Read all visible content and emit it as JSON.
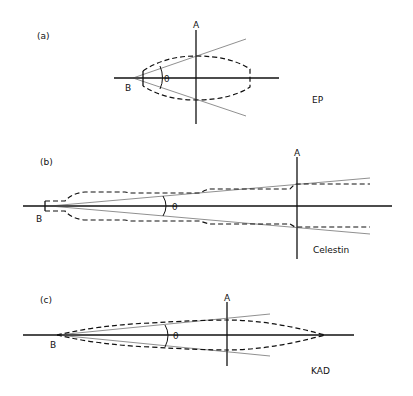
{
  "panels": [
    {
      "id": "a",
      "tag": "(a)",
      "axis_a": "A",
      "point_b": "B",
      "angle": "θ",
      "name": "EP"
    },
    {
      "id": "b",
      "tag": "(b)",
      "axis_a": "A",
      "point_b": "B",
      "angle": "θ",
      "name": "Celestin"
    },
    {
      "id": "c",
      "tag": "(c)",
      "axis_a": "A",
      "point_b": "B",
      "angle": "θ",
      "name": "KAD"
    }
  ]
}
